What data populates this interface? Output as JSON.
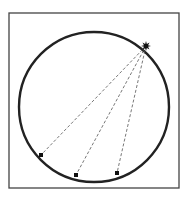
{
  "diagram": {
    "frame": {
      "x": 9,
      "y": 13,
      "width": 170,
      "height": 175,
      "stroke": "#444444"
    },
    "circle": {
      "cx": 94,
      "cy": 107,
      "r": 75,
      "stroke": "#222222"
    },
    "source_point": {
      "x": 146,
      "y": 46,
      "shape": "star",
      "color": "#111111"
    },
    "target_points": [
      {
        "x": 41,
        "y": 155
      },
      {
        "x": 76,
        "y": 175
      },
      {
        "x": 117,
        "y": 173
      }
    ],
    "line_style": "dashed",
    "line_color": "#555555"
  }
}
